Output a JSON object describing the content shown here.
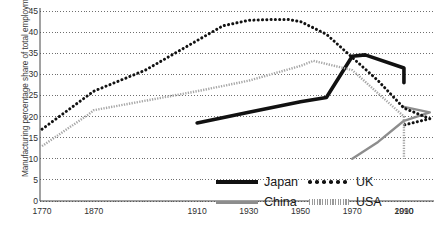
{
  "chart_data": {
    "type": "line",
    "title": "",
    "xlabel": "",
    "ylabel": "Manufacturing percentage share of total employment",
    "ylim": [
      0,
      45
    ],
    "yticks": [
      0,
      5,
      10,
      15,
      20,
      25,
      30,
      35,
      40,
      45
    ],
    "xticks": [
      "1770",
      "1870",
      "1910",
      "1930",
      "1950",
      "1970",
      "1990",
      "2010"
    ],
    "grid": true,
    "legend_position": "bottom-right",
    "series": [
      {
        "name": "Japan",
        "style": "thick-solid",
        "color": "#111111",
        "x": [
          1910,
          1930,
          1950,
          1960,
          1970,
          1975,
          1990,
          2010
        ],
        "values": [
          18.5,
          21.0,
          23.5,
          24.5,
          34.3,
          34.6,
          31.5,
          28.0
        ]
      },
      {
        "name": "China",
        "style": "solid",
        "color": "#8d8d8d",
        "x": [
          1970,
          1980,
          1990,
          2000,
          2010
        ],
        "values": [
          10.0,
          14.0,
          19.0,
          21.0,
          22.3
        ]
      },
      {
        "name": "UK",
        "style": "dotted",
        "color": "#111111",
        "x": [
          1770,
          1820,
          1870,
          1890,
          1910,
          1920,
          1930,
          1940,
          1945,
          1950,
          1960,
          1970,
          1980,
          1990,
          2000,
          2010
        ],
        "values": [
          17.0,
          21.5,
          26.0,
          31.0,
          38.0,
          41.5,
          42.8,
          43.0,
          43.0,
          42.5,
          39.5,
          34.0,
          28.5,
          22.0,
          19.5,
          18.0
        ]
      },
      {
        "name": "USA",
        "style": "dense-dotted",
        "color": "#a6a6a6",
        "x": [
          1770,
          1860,
          1870,
          1910,
          1930,
          1950,
          1955,
          1970,
          1990,
          2010
        ],
        "values": [
          13.0,
          20.5,
          21.5,
          26.0,
          28.5,
          32.0,
          33.2,
          31.0,
          20.0,
          10.0
        ]
      }
    ]
  },
  "axis": {
    "ylabel_text": "Manufacturing percentage share of total employment",
    "ytick_labels": [
      "0",
      "5",
      "10",
      "15",
      "20",
      "25",
      "30",
      "35",
      "40",
      "45"
    ],
    "xtick_labels": [
      "1770",
      "1870",
      "1910",
      "1930",
      "1950",
      "1970",
      "1990",
      "2010"
    ]
  },
  "legend": {
    "entries": [
      {
        "label": "Japan",
        "marker": "thick-solid-line-icon"
      },
      {
        "label": "UK",
        "marker": "dotted-line-icon"
      },
      {
        "label": "China",
        "marker": "thin-solid-line-icon"
      },
      {
        "label": "USA",
        "marker": "hatched-line-icon"
      }
    ]
  },
  "colors": {
    "japan": "#111111",
    "china": "#8d8d8d",
    "uk": "#111111",
    "usa": "#a6a6a6",
    "grid": "#555555",
    "text": "#2f2f2f"
  }
}
